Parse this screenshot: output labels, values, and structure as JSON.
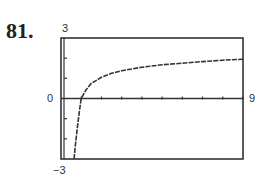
{
  "problem_number": "81.",
  "chart_data": {
    "type": "line",
    "title": "",
    "xlabel": "",
    "ylabel": "",
    "xlim": [
      0,
      9
    ],
    "ylim": [
      -3,
      3
    ],
    "axis_labels": {
      "ymax": "3",
      "ymin": "−3",
      "xmin": "0",
      "xmax": "9"
    },
    "x_ticks": [
      1,
      2,
      3,
      4,
      5,
      6,
      7,
      8,
      9
    ],
    "y_ticks": [
      -2,
      -1,
      1,
      2
    ],
    "grid": false,
    "series": [
      {
        "name": "f(x)",
        "x": [
          0.65,
          0.7,
          0.8,
          0.9,
          1.0,
          1.25,
          1.5,
          2,
          2.5,
          3,
          4,
          5,
          6,
          7,
          8,
          9
        ],
        "y": [
          -3.0,
          -2.4,
          -1.5,
          -0.7,
          0.0,
          0.45,
          0.75,
          1.05,
          1.25,
          1.38,
          1.55,
          1.67,
          1.75,
          1.83,
          1.9,
          1.95
        ]
      }
    ]
  }
}
